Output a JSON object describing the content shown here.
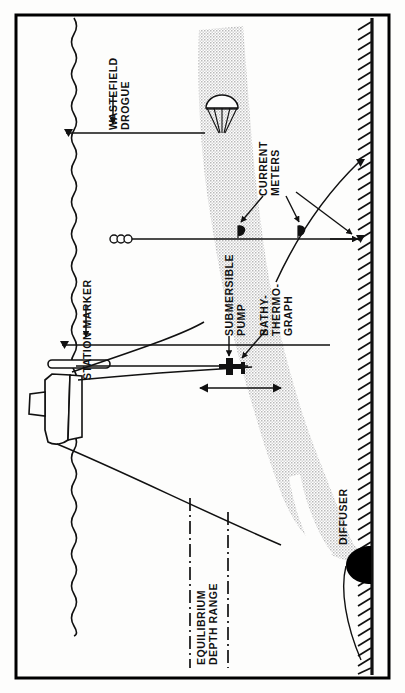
{
  "figure": {
    "orientation": "labels rotated 90 degrees counter-clockwise",
    "colors": {
      "ink": "#111111",
      "plume_fill": "#c9c9c9",
      "diffuser_fill": "#000000",
      "background": "#fdfdfc",
      "border": "#000000"
    }
  },
  "labels": {
    "wastefield_drogue": "WASTEFIELD\nDROGUE",
    "station_marker": "STATION MARKER",
    "current_meters": "CURRENT\nMETERS",
    "submersible_pump": "SUBMERSIBLE\nPUMP",
    "bathythermograph": "BATHY-\nTHERMO-\nGRAPH",
    "equilibrium_depth_range": "EQUILIBRIUM\nDEPTH RANGE",
    "diffuser": "DIFFUSER"
  },
  "elements": {
    "sea_surface": "wavy vertical line at left",
    "seafloor": "hatched vertical line at right",
    "plume": "grey stippled wastefield plume",
    "research_vessel": "ship on sea surface",
    "drogue_parachute": "parachute drogue",
    "current_meter_1": "current meter vane",
    "current_meter_2": "current meter vane",
    "float_string": "three surface floats",
    "pump_traverse_arrow": "double headed traverse arrow",
    "equilibrium_line_upper": "dash-dot line",
    "equilibrium_line_lower": "dash-dot line"
  }
}
